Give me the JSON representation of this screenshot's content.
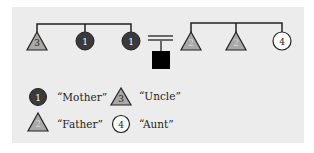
{
  "colors": {
    "panel_bg": "#ececec",
    "line": "#222222",
    "dark_circle": "#3a3a3a",
    "triangle_fill": "#a8a8a8",
    "affected_square": "#000000",
    "aunt_circle": "#ffffff"
  },
  "pedigree": {
    "left_sibship": [
      {
        "shape": "triangle",
        "label": "3"
      },
      {
        "shape": "dark-circle",
        "label": "1"
      },
      {
        "shape": "dark-circle",
        "label": "1"
      }
    ],
    "right_sibship": [
      {
        "shape": "triangle",
        "label": "2"
      },
      {
        "shape": "triangle",
        "label": "2"
      },
      {
        "shape": "circle",
        "label": "4"
      }
    ],
    "child": {
      "shape": "filled-square"
    }
  },
  "legend": [
    {
      "symbol": "dark-circle",
      "number": "1",
      "label": "“Mother”"
    },
    {
      "symbol": "triangle",
      "number": "3",
      "label": "“Uncle”"
    },
    {
      "symbol": "triangle",
      "number": "2",
      "label": "“Father”"
    },
    {
      "symbol": "circle",
      "number": "4",
      "label": "“Aunt”"
    }
  ]
}
